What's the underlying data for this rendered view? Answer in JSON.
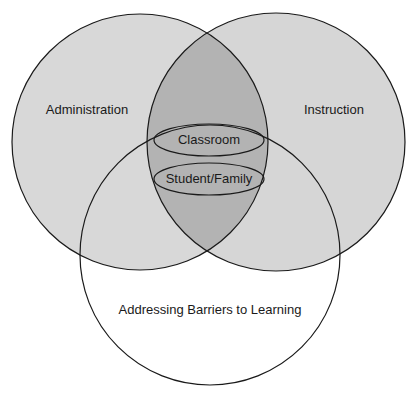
{
  "diagram": {
    "type": "venn",
    "sets": [
      {
        "id": "administration",
        "label": "Administration"
      },
      {
        "id": "instruction",
        "label": "Instruction"
      },
      {
        "id": "barriers",
        "label": "Addressing Barriers to Learning"
      }
    ],
    "center_items": [
      {
        "id": "classroom",
        "label": "Classroom"
      },
      {
        "id": "student_family",
        "label": "Student/Family"
      }
    ],
    "colors": {
      "circle_fill": "#d8d8d8",
      "overlap_fill": "#b3b3b3",
      "bottom_fill": "#ffffff",
      "stroke": "#1a1a1a",
      "background": "#ffffff"
    }
  }
}
